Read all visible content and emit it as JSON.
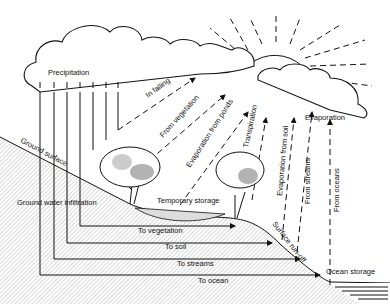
{
  "diagram": {
    "labels": {
      "precipitation": "Precipitation",
      "in_falling": "In falling",
      "from_vegetation": "From vegetation",
      "evaporation_from_ponds": "Evaporation from ponds",
      "transpiration": "Transpiration",
      "evaporation_from_soil": "Evaporation from soil",
      "from_streams": "From streams",
      "from_oceans": "From oceans",
      "evaporation": "Evaporation",
      "ground_surface": "Ground surface",
      "ground_water_infiltration": "Ground water infiltration",
      "temporary_storage": "Temporary storage",
      "to_vegetation": "To vegetation",
      "to_soil": "To soil",
      "to_streams": "To streams",
      "to_ocean": "To ocean",
      "surface_run_off": "Surface run-off",
      "ocean_storage": "Ocean storage"
    },
    "icons": [
      "cloud-icon",
      "sun-icon",
      "tree-icon",
      "pond-icon",
      "ocean-icon",
      "ground-slope-icon"
    ]
  }
}
